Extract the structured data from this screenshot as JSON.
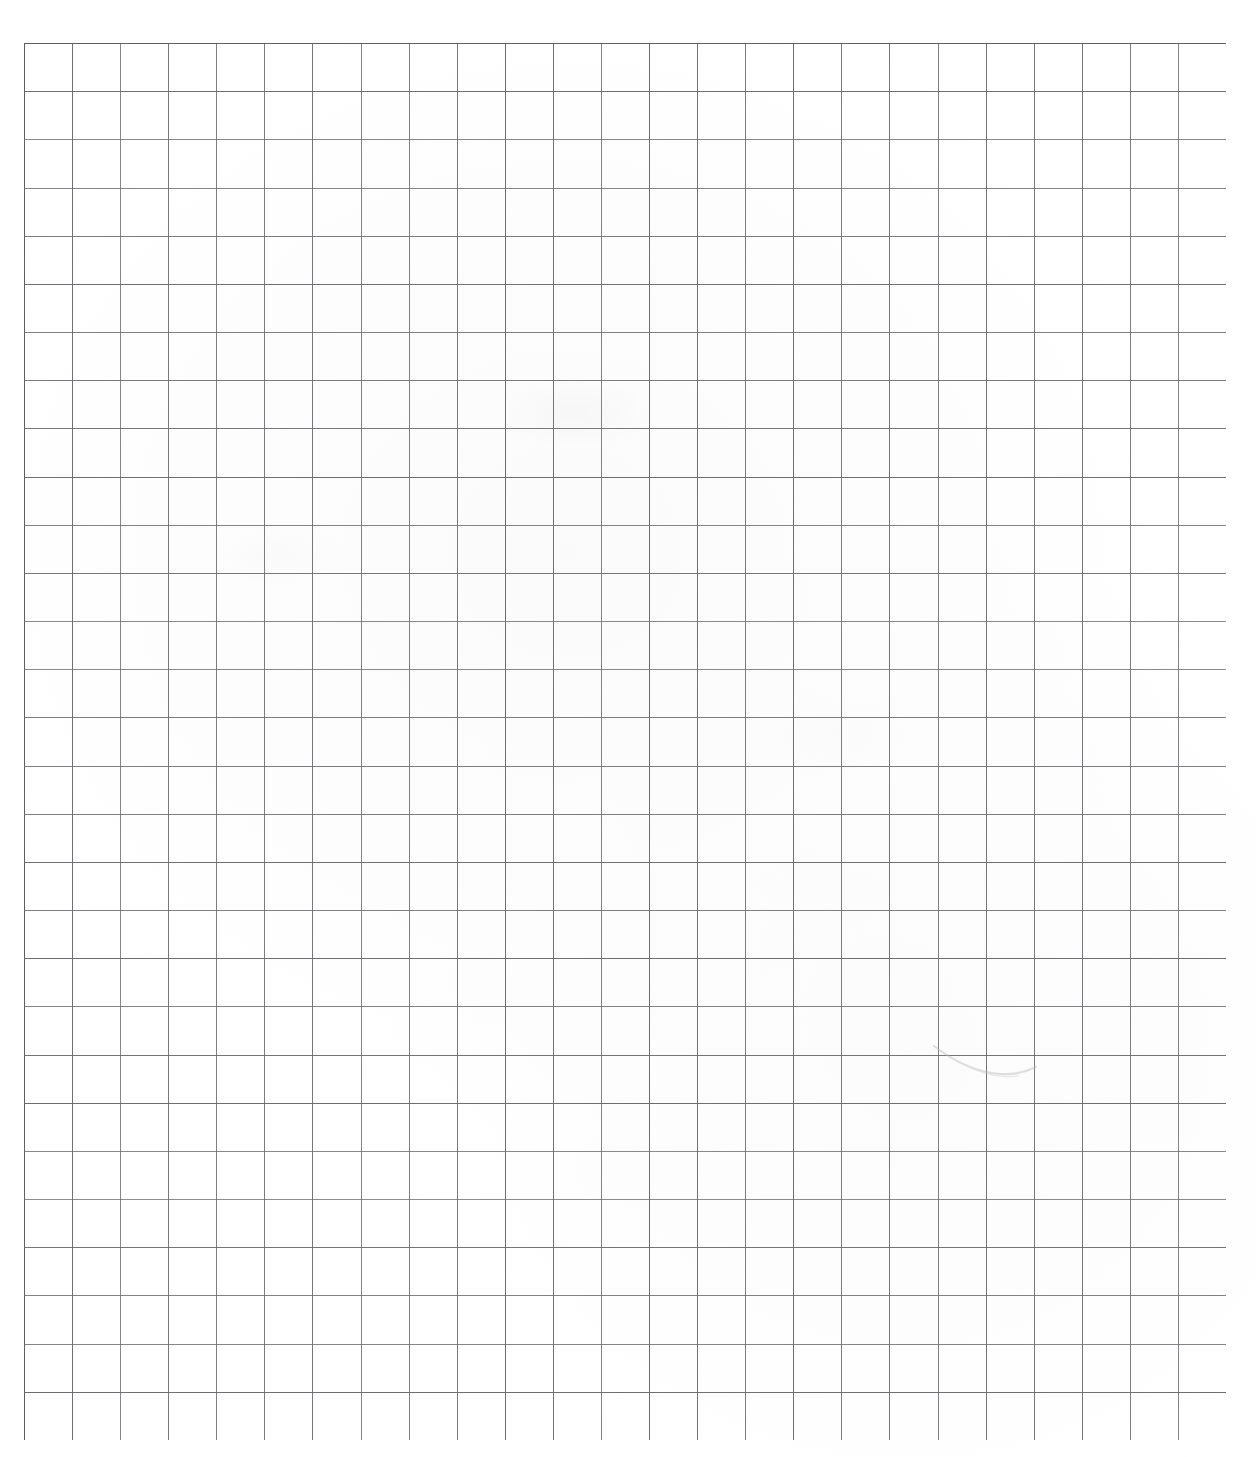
{
  "document": {
    "kind": "grid-paper-scan",
    "title": "Blank grid paper",
    "page_width": 1256,
    "page_height": 1457,
    "background_color": "#ffffff",
    "has_text": false,
    "has_handwriting": false,
    "notes": "Scanned blank sheet of squared / graph paper. No printed or handwritten text is present; only the ruled grid and a few faint pencil smudges."
  },
  "grid": {
    "origin_x": 24,
    "origin_y": 43,
    "right_edge_x": 1226,
    "bottom_edge_y": 1440,
    "width": 1202,
    "height": 1397,
    "columns": 25,
    "rows": 29,
    "cell_width": 48.08,
    "cell_height": 48.17,
    "line_color": "#6b6b6f",
    "line_color_light": "#8d8d92",
    "line_width": 1.1,
    "border_color": "#5f5f63",
    "border_width": 1.3
  },
  "margins": {
    "left": 24,
    "top": 43,
    "right": 30,
    "bottom": 17
  },
  "artifacts": [
    {
      "name": "pencil-curve-smudge",
      "type": "curve",
      "x": 930,
      "y": 1040,
      "width": 110,
      "height": 44,
      "color": "#b9b9bd",
      "opacity": 0.45
    },
    {
      "name": "faint-smudge-upper-center",
      "type": "blur",
      "x": 500,
      "y": 378,
      "width": 150,
      "height": 70,
      "opacity": 0.3
    },
    {
      "name": "faint-smudge-mid-left",
      "type": "blur",
      "x": 210,
      "y": 525,
      "width": 130,
      "height": 60,
      "opacity": 0.22
    },
    {
      "name": "faint-smudge-mid-right",
      "type": "blur",
      "x": 760,
      "y": 700,
      "width": 160,
      "height": 72,
      "opacity": 0.18
    },
    {
      "name": "faint-smudge-lower-center",
      "type": "blur",
      "x": 560,
      "y": 1130,
      "width": 170,
      "height": 76,
      "opacity": 0.16
    }
  ]
}
